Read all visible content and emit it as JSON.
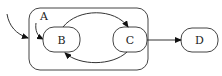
{
  "diagram": {
    "type": "statechart",
    "colors": {
      "stroke": "#444444",
      "text": "#222222",
      "background": "#ffffff"
    },
    "composite_state": {
      "id": "A",
      "label": "A"
    },
    "states": [
      {
        "id": "B",
        "label": "B",
        "parent": "A"
      },
      {
        "id": "C",
        "label": "C",
        "parent": "A"
      },
      {
        "id": "D",
        "label": "D",
        "parent": null
      }
    ],
    "transitions": [
      {
        "from": "initial-outer",
        "to": "A"
      },
      {
        "from": "initial-inner",
        "to": "B"
      },
      {
        "from": "B",
        "to": "C"
      },
      {
        "from": "C",
        "to": "B"
      },
      {
        "from": "C",
        "to": "D"
      }
    ]
  }
}
